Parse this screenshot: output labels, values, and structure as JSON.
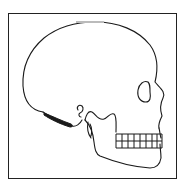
{
  "figure": {
    "stroke_color": "#1a1a1a",
    "background_color": "#ffffff",
    "frame_color": "#222222"
  }
}
